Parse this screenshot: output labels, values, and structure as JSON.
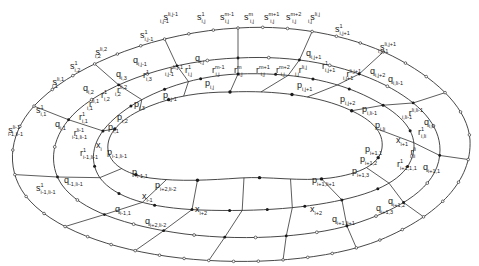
{
  "figure": {
    "kind": "nested closed curves with labeled lattice points",
    "curves": [
      "inner-curve-p",
      "curve-r-x",
      "curve-q",
      "outer-curve-s"
    ],
    "colors": {
      "stroke": "#333333",
      "filled_dot": "#1a1a1a",
      "open_dot": "#ffffff",
      "background": "#ffffff"
    }
  },
  "labels": {
    "top": [
      {
        "id": "s_i_j-1",
        "base": "s",
        "sup": "l_{i,j-1}",
        "sub": "i,j-1",
        "x": 160,
        "y": 20
      },
      {
        "id": "s_ij_1",
        "base": "s",
        "sup": "1",
        "sub": "i,j",
        "x": 197,
        "y": 20
      },
      {
        "id": "s_ij_m-1",
        "base": "s",
        "sup": "m-1",
        "sub": "i,j",
        "x": 220,
        "y": 20
      },
      {
        "id": "s_ij_m",
        "base": "s",
        "sup": "m",
        "sub": "i,j",
        "x": 244,
        "y": 20
      },
      {
        "id": "s_ij_m+1",
        "base": "s",
        "sup": "m+1",
        "sub": "i,j",
        "x": 264,
        "y": 20
      },
      {
        "id": "s_ij_m+2",
        "base": "s",
        "sup": "m+2",
        "sub": "i,j",
        "x": 286,
        "y": 20
      },
      {
        "id": "s_ij_lij",
        "base": "s",
        "sup": "l_{i,j}",
        "sub": "i,j",
        "x": 308,
        "y": 20
      },
      {
        "id": "s_ij+1_1",
        "base": "s",
        "sup": "1",
        "sub": "i,j+1",
        "x": 335,
        "y": 32
      },
      {
        "id": "s_ij+1_l",
        "base": "s",
        "sup": "l_{i,j+1}",
        "sub": "i,j+1",
        "x": 378,
        "y": 50
      },
      {
        "id": "s_i1_1",
        "base": "s",
        "sup": "1",
        "sub": "i,j-1",
        "x": 140,
        "y": 38
      },
      {
        "id": "s_i2_l",
        "base": "s",
        "sup": "l_{i,2}",
        "sub": "i,2",
        "x": 95,
        "y": 55
      },
      {
        "id": "s_i2_1",
        "base": "s",
        "sup": "1",
        "sub": "i,2",
        "x": 70,
        "y": 69
      },
      {
        "id": "s_i1_li1",
        "base": "s",
        "sup": "l_{i,1}",
        "sub": "i,1",
        "x": 52,
        "y": 85
      },
      {
        "id": "s_i1_1b",
        "base": "s",
        "sup": "1",
        "sub": "i,1",
        "x": 36,
        "y": 113
      },
      {
        "id": "s_i-1_l",
        "base": "s",
        "sup": "l_{i-1}",
        "sub": "i-1,l_i-1",
        "x": 8,
        "y": 133
      },
      {
        "id": "s_i-1_1",
        "base": "s",
        "sup": "1",
        "sub": "i-1,l_i-1",
        "x": 36,
        "y": 191
      }
    ],
    "q_labels": [
      {
        "id": "q_ij",
        "base": "q",
        "sub": "i,j",
        "x": 195,
        "y": 61
      },
      {
        "id": "q_ij-1",
        "base": "q",
        "sub": "i,j-1",
        "x": 133,
        "y": 63
      },
      {
        "id": "q_i3",
        "base": "q",
        "sub": "i,3",
        "x": 116,
        "y": 77
      },
      {
        "id": "q_i2",
        "base": "q",
        "sub": "i,2",
        "x": 83,
        "y": 91
      },
      {
        "id": "q_i1",
        "base": "q",
        "sub": "i,1",
        "x": 55,
        "y": 127
      },
      {
        "id": "q_ij+1",
        "base": "q",
        "sub": "i,j+1",
        "x": 306,
        "y": 56
      },
      {
        "id": "q_ij+2",
        "base": "q",
        "sub": "i,j+2",
        "x": 370,
        "y": 74
      },
      {
        "id": "q_ili-1",
        "base": "q",
        "sub": "i,l_i-1",
        "x": 388,
        "y": 82
      },
      {
        "id": "q_ili",
        "base": "q",
        "sub": "i,l_i",
        "x": 424,
        "y": 125
      },
      {
        "id": "q_i+1_1",
        "base": "q",
        "sub": "i+1,1",
        "x": 423,
        "y": 170
      },
      {
        "id": "q_i+1_2",
        "base": "q",
        "sub": "i+1,2",
        "x": 388,
        "y": 204
      },
      {
        "id": "q_i+1_3",
        "base": "q",
        "sub": "i+1,3",
        "x": 376,
        "y": 211
      },
      {
        "id": "q_i+1_li+1",
        "base": "q",
        "sub": "i+1,l_i+1",
        "x": 332,
        "y": 222
      },
      {
        "id": "q_i-1_1",
        "base": "q",
        "sub": "i-1,1",
        "x": 115,
        "y": 212
      },
      {
        "id": "q_i+2_li-2",
        "base": "q",
        "sub": "i+2,l_i-2",
        "x": 145,
        "y": 224
      },
      {
        "id": "q_i-1_li-1",
        "base": "q",
        "sub": "-1,l_i-1",
        "x": 64,
        "y": 183
      }
    ],
    "r_labels": [
      {
        "id": "r_ij_1",
        "base": "r",
        "sup": "1",
        "sub": "i,j",
        "x": 185,
        "y": 73
      },
      {
        "id": "r_ij_m-1",
        "base": "r",
        "sup": "m-1",
        "sub": "i,j",
        "x": 212,
        "y": 73
      },
      {
        "id": "r_ij_m",
        "base": "r",
        "sup": "m",
        "sub": "i,j",
        "x": 234,
        "y": 73
      },
      {
        "id": "r_ij_m+1",
        "base": "r",
        "sup": "m+1",
        "sub": "i,j",
        "x": 256,
        "y": 73
      },
      {
        "id": "r_ij_m+2",
        "base": "r",
        "sup": "m+2",
        "sub": "i,j",
        "x": 276,
        "y": 73
      },
      {
        "id": "r_ij_lij",
        "base": "r",
        "sup": "l_{i,j}",
        "sub": "i,j",
        "x": 295,
        "y": 73
      },
      {
        "id": "r_ij-1_l",
        "base": "r",
        "sup": "l_{i,j-1}",
        "sub": "i,j-1",
        "x": 165,
        "y": 73
      },
      {
        "id": "r_ij+1_1",
        "base": "r",
        "sup": "1",
        "sub": "i,j+1",
        "x": 322,
        "y": 69
      },
      {
        "id": "r_ij+1_l",
        "base": "r",
        "sup": "l_{i,j+1}",
        "sub": "i,j+1",
        "x": 343,
        "y": 77
      },
      {
        "id": "r_i3_1",
        "base": "r",
        "sup": "1",
        "sub": "i,3",
        "x": 143,
        "y": 78
      },
      {
        "id": "r_i2_l",
        "base": "r",
        "sup": "l_{i,2}",
        "sub": "i,2",
        "x": 115,
        "y": 93
      },
      {
        "id": "r_i2_1",
        "base": "r",
        "sup": "1",
        "sub": "i,2",
        "x": 101,
        "y": 98
      },
      {
        "id": "r_i1_l",
        "base": "r",
        "sup": "l_{i,1}",
        "sub": "i,1",
        "x": 87,
        "y": 107
      },
      {
        "id": "r_i1_1",
        "base": "r",
        "sup": "1",
        "sub": "i,1",
        "x": 79,
        "y": 120
      },
      {
        "id": "r_i-1_l",
        "base": "r",
        "sup": "l_{i-1}",
        "sub": "i-1,l_i-1",
        "x": 72,
        "y": 136
      },
      {
        "id": "r_i-1_1",
        "base": "r",
        "sup": "1",
        "sub": "i-1,l_i-1",
        "x": 80,
        "y": 156
      },
      {
        "id": "r_ili-1_l",
        "base": "r",
        "sup": "l_{i,l_i-1}",
        "sub": "i,l_i-1",
        "x": 402,
        "y": 116
      },
      {
        "id": "r_ili_1",
        "base": "r",
        "sup": "1",
        "sub": "i,l_i",
        "x": 418,
        "y": 135
      },
      {
        "id": "r_ili_l",
        "base": "r",
        "sup": "l_i",
        "sub": "i,l_i",
        "x": 410,
        "y": 155
      },
      {
        "id": "r_i+1_1",
        "base": "r",
        "sup": "1",
        "sub": "i+1,1,1",
        "x": 397,
        "y": 167
      }
    ],
    "p_labels": [
      {
        "id": "p_ij",
        "base": "p",
        "sub": "i,j",
        "x": 205,
        "y": 86
      },
      {
        "id": "p_ij-1",
        "base": "p",
        "sub": "i,j-1",
        "x": 163,
        "y": 98
      },
      {
        "id": "p_ij+1",
        "base": "p",
        "sub": "i,j+1",
        "x": 297,
        "y": 88
      },
      {
        "id": "p_ij+2",
        "base": "p",
        "sub": "i,j+2",
        "x": 340,
        "y": 102
      },
      {
        "id": "p_ili-1",
        "base": "p",
        "sub": "i,l_i-1",
        "x": 362,
        "y": 112
      },
      {
        "id": "p_ili",
        "base": "p",
        "sub": "i,l_i",
        "x": 375,
        "y": 128
      },
      {
        "id": "p_i3",
        "base": "p",
        "sub": "i,3",
        "x": 134,
        "y": 107
      },
      {
        "id": "p_i2",
        "base": "p",
        "sub": "i,2",
        "x": 117,
        "y": 120
      },
      {
        "id": "p_i1",
        "base": "p",
        "sub": "i,1",
        "x": 108,
        "y": 130
      },
      {
        "id": "p_i-1_li-1",
        "base": "p",
        "sub": "i-1,l_i-1",
        "x": 107,
        "y": 155
      },
      {
        "id": "p_i-1_1",
        "base": "p",
        "sub": "i-1,1",
        "x": 132,
        "y": 175
      },
      {
        "id": "p_i+2_li-2",
        "base": "p",
        "sub": "i+2,l_i-2",
        "x": 155,
        "y": 188
      },
      {
        "id": "p_i+1_1",
        "base": "p",
        "sub": "i+1,1",
        "x": 365,
        "y": 152
      },
      {
        "id": "p_i+1_2",
        "base": "p",
        "sub": "i+1,2",
        "x": 360,
        "y": 162
      },
      {
        "id": "p_i+1_3",
        "base": "p",
        "sub": "i+1,3",
        "x": 352,
        "y": 174
      },
      {
        "id": "p_i+1_li+1",
        "base": "p",
        "sub": "i+1,l_i+1",
        "x": 312,
        "y": 183
      }
    ],
    "x_labels": [
      {
        "id": "x_i",
        "base": "x",
        "sub": "i",
        "x": 96,
        "y": 148
      },
      {
        "id": "x_i-1",
        "base": "x",
        "sub": "i-1",
        "x": 142,
        "y": 199
      },
      {
        "id": "x_i+2_left",
        "base": "x",
        "sub": "i+2",
        "x": 195,
        "y": 212
      },
      {
        "id": "x_i+2_right",
        "base": "x",
        "sub": "i+2",
        "x": 310,
        "y": 212
      },
      {
        "id": "x_i+1",
        "base": "x",
        "sub": "i+1",
        "x": 396,
        "y": 143
      }
    ]
  }
}
